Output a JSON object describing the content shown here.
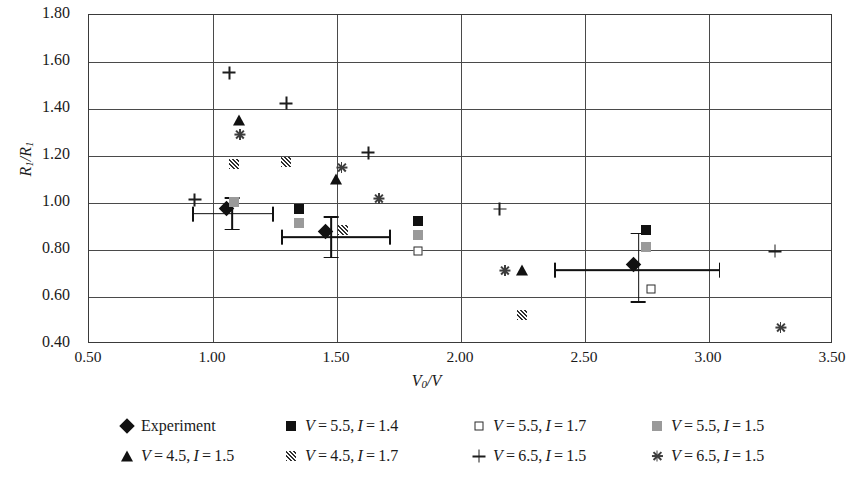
{
  "chart_data": {
    "type": "scatter",
    "title": "",
    "xlabel": "V0/V",
    "ylabel": "R1/R1",
    "xlim": [
      0.5,
      3.5
    ],
    "ylim": [
      0.4,
      1.8
    ],
    "xticks": [
      "0.50",
      "1.00",
      "1.50",
      "2.00",
      "2.50",
      "3.00",
      "3.50"
    ],
    "yticks": [
      "1.80",
      "1.60",
      "1.40",
      "1.20",
      "1.00",
      "0.80",
      "0.60",
      "0.40"
    ],
    "grid": "both",
    "legend_position": "bottom",
    "series": [
      {
        "name": "Experiment",
        "marker": "filled-diamond",
        "color": "#111111",
        "points": [
          {
            "x": 1.08,
            "y": 0.95,
            "xerr_low": 0.92,
            "xerr_high": 1.25,
            "yerr_low": 0.88,
            "yerr_high": 1.02
          },
          {
            "x": 1.48,
            "y": 0.85,
            "xerr_low": 1.28,
            "xerr_high": 1.72,
            "yerr_low": 0.76,
            "yerr_high": 0.94
          },
          {
            "x": 2.72,
            "y": 0.71,
            "xerr_low": 2.38,
            "xerr_high": 3.05,
            "yerr_low": 0.57,
            "yerr_high": 0.87
          }
        ]
      },
      {
        "name": "V = 5.5, I = 1.4",
        "marker": "filled-square",
        "color": "#111111",
        "points": [
          {
            "x": 1.35,
            "y": 0.97
          },
          {
            "x": 1.83,
            "y": 0.92
          },
          {
            "x": 2.75,
            "y": 0.88
          }
        ]
      },
      {
        "name": "V = 5.5, I = 1.7",
        "marker": "open-square",
        "color": "#2b2b2b",
        "points": [
          {
            "x": 1.09,
            "y": 1.0
          },
          {
            "x": 1.83,
            "y": 0.79
          },
          {
            "x": 2.77,
            "y": 0.63
          }
        ]
      },
      {
        "name": "V = 5.5, I = 1.5",
        "marker": "grey-square",
        "color": "#9a9a9a",
        "points": [
          {
            "x": 1.09,
            "y": 1.0
          },
          {
            "x": 1.35,
            "y": 0.91
          },
          {
            "x": 1.83,
            "y": 0.86
          },
          {
            "x": 2.75,
            "y": 0.81
          }
        ]
      },
      {
        "name": "V = 4.5, I = 1.5",
        "marker": "filled-triangle",
        "color": "#111111",
        "points": [
          {
            "x": 1.11,
            "y": 1.35
          },
          {
            "x": 1.5,
            "y": 1.1
          },
          {
            "x": 2.25,
            "y": 0.71
          }
        ]
      },
      {
        "name": "V = 4.5, I = 1.7",
        "marker": "hatched-square",
        "color": "#2f2f2f",
        "points": [
          {
            "x": 1.09,
            "y": 1.16
          },
          {
            "x": 1.3,
            "y": 1.17
          },
          {
            "x": 1.53,
            "y": 0.88
          },
          {
            "x": 2.25,
            "y": 0.52
          }
        ]
      },
      {
        "name": "V = 6.5, I = 1.5",
        "marker": "plus",
        "color": "#1d1d1d",
        "points": [
          {
            "x": 1.07,
            "y": 1.55
          },
          {
            "x": 1.3,
            "y": 1.42
          },
          {
            "x": 1.63,
            "y": 1.21
          },
          {
            "x": 0.93,
            "y": 1.01
          },
          {
            "x": 2.16,
            "y": 0.97
          },
          {
            "x": 3.27,
            "y": 0.79
          }
        ]
      },
      {
        "name": "V = 6.5, I = 1.5 ",
        "marker": "asterisk",
        "color": "#3d3d3d",
        "points": [
          {
            "x": 1.09,
            "y": 1.31
          },
          {
            "x": 1.5,
            "y": 1.17
          },
          {
            "x": 1.65,
            "y": 1.04
          },
          {
            "x": 2.16,
            "y": 0.73
          },
          {
            "x": 3.27,
            "y": 0.49
          }
        ]
      }
    ]
  },
  "axes": {
    "y_label_main": "R",
    "y_label_sub1": "1",
    "y_label_slash": "/R",
    "y_label_sub2": "1",
    "x_label_main": "V",
    "x_label_sub": "0",
    "x_label_rest": "/V"
  },
  "legend": {
    "items": [
      {
        "symbol": "filled-diamond",
        "label": "Experiment"
      },
      {
        "symbol": "filled-square",
        "label": "V = 5.5, I  = 1.4"
      },
      {
        "symbol": "open-square",
        "label": "V = 5.5, I  = 1.7"
      },
      {
        "symbol": "grey-square",
        "label": "V = 5.5, I  = 1.5"
      },
      {
        "symbol": "filled-triangle",
        "label": "V = 4.5, I  = 1.5"
      },
      {
        "symbol": "hatched-square",
        "label": "V = 4.5, I  = 1.7"
      },
      {
        "symbol": "plus",
        "label": "V = 6.5, I  = 1.5"
      },
      {
        "symbol": "asterisk",
        "label": "V = 6.5, I  = 1.5"
      }
    ]
  }
}
